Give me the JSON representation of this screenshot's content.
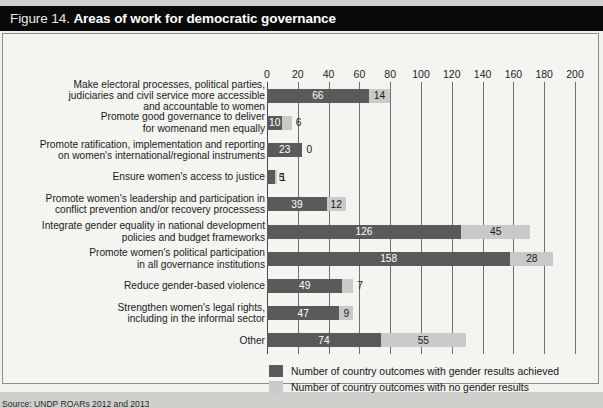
{
  "figure": {
    "number_label": "Figure 14.",
    "title": "Areas of work for democratic governance",
    "source": "Source: UNDP ROARs 2012 and 2013"
  },
  "legend": {
    "position": "bottom-left",
    "entries": [
      {
        "label": "Number of country outcomes with gender results achieved",
        "color": "#5a5a5a"
      },
      {
        "label": "Number of country outcomes with no gender results",
        "color": "#c9c9c9"
      }
    ]
  },
  "chart_data": {
    "type": "bar",
    "orientation": "horizontal",
    "stacked": true,
    "title": "Areas of work for democratic governance",
    "xlabel": "",
    "ylabel": "",
    "xlim": [
      0,
      200
    ],
    "xticks": [
      0,
      20,
      40,
      60,
      80,
      100,
      120,
      140,
      160,
      180,
      200
    ],
    "grid": true,
    "categories": [
      "Make electoral processes, political parties,\njudiciaries and civil service more accessible\nand accountable to women",
      "Promote good governance to deliver\nfor womenand men equally",
      "Promote ratification, implementation and reporting\non women's international/regional instruments",
      "Ensure women's access to justice",
      "Promote women's leadership and participation in\nconflict prevention and/or recovery processess",
      "Integrate gender equality in national development\npolicies and budget frameworks",
      "Promote women's political participation\nin all governance institutions",
      "Reduce gender-based violence",
      "Strengthen women's legal rights,\nincluding in the informal sector",
      "Other"
    ],
    "series": [
      {
        "name": "Number of country outcomes with gender results achieved",
        "color": "#5a5a5a",
        "values": [
          66,
          10,
          23,
          5,
          39,
          126,
          158,
          49,
          47,
          74
        ]
      },
      {
        "name": "Number of country outcomes with no gender results",
        "color": "#c9c9c9",
        "values": [
          14,
          6,
          0,
          1,
          12,
          45,
          28,
          7,
          9,
          55
        ]
      }
    ]
  }
}
